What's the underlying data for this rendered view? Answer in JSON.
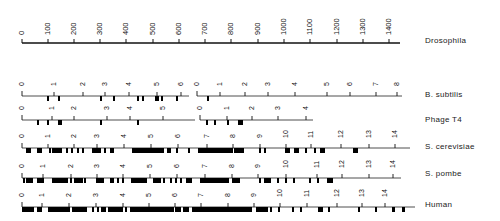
{
  "figure": {
    "scale": {
      "name": "Drosophila",
      "ticks": [
        "0",
        "100",
        "200",
        "300",
        "400",
        "500",
        "600",
        "700",
        "800",
        "900",
        "1000",
        "1100",
        "1200",
        "1300",
        "1400"
      ],
      "x_start": 22,
      "x_end": 150,
      "y": 43,
      "tick_positions": [
        22,
        48,
        74,
        100,
        126,
        153,
        179,
        205,
        231,
        258,
        284,
        310,
        337,
        363,
        389
      ],
      "line_end": 400
    },
    "tracks": [
      {
        "name": "B. subtilis",
        "y": 96,
        "segments": [
          {
            "line": [
              22,
              189
            ],
            "ticks": [
              {
                "l": "0",
                "x": 22
              },
              {
                "l": "1",
                "x": 54
              },
              {
                "l": "2",
                "x": 83
              },
              {
                "l": "3",
                "x": 105
              },
              {
                "l": "4",
                "x": 129
              },
              {
                "l": "5",
                "x": 157
              },
              {
                "l": "6",
                "x": 181
              }
            ]
          },
          {
            "line": [
              197,
              402
            ],
            "ticks": [
              {
                "l": "0",
                "x": 197
              },
              {
                "l": "1",
                "x": 220
              },
              {
                "l": "2",
                "x": 245
              },
              {
                "l": "3",
                "x": 268
              },
              {
                "l": "4",
                "x": 295
              },
              {
                "l": "5",
                "x": 327
              },
              {
                "l": "6",
                "x": 350
              },
              {
                "l": "7",
                "x": 376
              },
              {
                "l": "8",
                "x": 397
              }
            ]
          }
        ],
        "blocks": [
          [
            47,
            2
          ],
          [
            58,
            2
          ],
          [
            100,
            2
          ],
          [
            113,
            2
          ],
          [
            137,
            2
          ],
          [
            142,
            2
          ],
          [
            155,
            4
          ],
          [
            161,
            2
          ],
          [
            176,
            2
          ],
          [
            207,
            2
          ]
        ]
      },
      {
        "name": "Phage T4",
        "y": 120,
        "segments": [
          {
            "line": [
              22,
              195
            ],
            "ticks": [
              {
                "l": "0",
                "x": 22
              },
              {
                "l": "1",
                "x": 52
              },
              {
                "l": "2",
                "x": 74
              },
              {
                "l": "3",
                "x": 107
              },
              {
                "l": "4",
                "x": 130
              },
              {
                "l": "5",
                "x": 163
              }
            ]
          },
          {
            "line": [
              200,
              313
            ],
            "ticks": [
              {
                "l": "0",
                "x": 200
              },
              {
                "l": "1",
                "x": 227
              },
              {
                "l": "2",
                "x": 252
              },
              {
                "l": "3",
                "x": 278
              },
              {
                "l": "4",
                "x": 306
              }
            ]
          }
        ],
        "blocks": [
          [
            37,
            2
          ],
          [
            47,
            2
          ],
          [
            58,
            4
          ],
          [
            100,
            2
          ],
          [
            137,
            2
          ],
          [
            206,
            2
          ],
          [
            214,
            2
          ],
          [
            227,
            2
          ],
          [
            238,
            5
          ]
        ]
      },
      {
        "name": "S. cerevisiae",
        "y": 148,
        "segments": [
          {
            "line": [
              22,
              410
            ],
            "ticks": [
              {
                "l": "0",
                "x": 22
              },
              {
                "l": "1",
                "x": 48
              },
              {
                "l": "2",
                "x": 74
              },
              {
                "l": "3",
                "x": 97
              },
              {
                "l": "4",
                "x": 124
              },
              {
                "l": "5",
                "x": 151
              },
              {
                "l": "6",
                "x": 178
              },
              {
                "l": "7",
                "x": 207
              },
              {
                "l": "8",
                "x": 233
              },
              {
                "l": "9",
                "x": 260
              },
              {
                "l": "10",
                "x": 286
              },
              {
                "l": "11",
                "x": 311
              },
              {
                "l": "12",
                "x": 341
              },
              {
                "l": "13",
                "x": 369
              },
              {
                "l": "14",
                "x": 395
              }
            ]
          }
        ],
        "blocks": [
          [
            26,
            5
          ],
          [
            37,
            5
          ],
          [
            49,
            2
          ],
          [
            52,
            10
          ],
          [
            66,
            2
          ],
          [
            71,
            2
          ],
          [
            77,
            2
          ],
          [
            82,
            2
          ],
          [
            92,
            9
          ],
          [
            104,
            2
          ],
          [
            110,
            4
          ],
          [
            132,
            32
          ],
          [
            167,
            4
          ],
          [
            176,
            2
          ],
          [
            188,
            2
          ],
          [
            198,
            35
          ],
          [
            234,
            10
          ],
          [
            259,
            2
          ],
          [
            264,
            2
          ],
          [
            285,
            5
          ],
          [
            294,
            5
          ],
          [
            305,
            2
          ],
          [
            314,
            2
          ],
          [
            320,
            5
          ],
          [
            353,
            5
          ]
        ]
      },
      {
        "name": "S. pombe",
        "y": 178,
        "segments": [
          {
            "line": [
              22,
              401
            ],
            "ticks": [
              {
                "l": "0",
                "x": 22
              },
              {
                "l": "1",
                "x": 43
              },
              {
                "l": "2",
                "x": 71
              },
              {
                "l": "3",
                "x": 97
              },
              {
                "l": "4",
                "x": 123
              },
              {
                "l": "5",
                "x": 150
              },
              {
                "l": "6",
                "x": 177
              },
              {
                "l": "7",
                "x": 205
              },
              {
                "l": "8",
                "x": 232
              },
              {
                "l": "9",
                "x": 258
              },
              {
                "l": "10",
                "x": 286
              },
              {
                "l": "11",
                "x": 317
              },
              {
                "l": "12",
                "x": 342
              },
              {
                "l": "13",
                "x": 369
              },
              {
                "l": "14",
                "x": 393
              }
            ]
          }
        ],
        "blocks": [
          [
            23,
            2
          ],
          [
            26,
            7
          ],
          [
            37,
            7
          ],
          [
            52,
            16
          ],
          [
            70,
            2
          ],
          [
            74,
            9
          ],
          [
            84,
            2
          ],
          [
            96,
            8
          ],
          [
            110,
            4
          ],
          [
            117,
            2
          ],
          [
            122,
            2
          ],
          [
            131,
            16
          ],
          [
            153,
            8
          ],
          [
            163,
            2
          ],
          [
            170,
            2
          ],
          [
            175,
            2
          ],
          [
            180,
            2
          ],
          [
            186,
            6
          ],
          [
            200,
            29
          ],
          [
            232,
            8
          ],
          [
            259,
            2
          ],
          [
            264,
            7
          ],
          [
            277,
            2
          ],
          [
            285,
            2
          ],
          [
            293,
            2
          ],
          [
            309,
            2
          ],
          [
            317,
            2
          ],
          [
            327,
            6
          ]
        ]
      },
      {
        "name": "Human",
        "y": 207,
        "segments": [
          {
            "line": [
              22,
              415
            ],
            "ticks": [
              {
                "l": "0",
                "x": 22
              },
              {
                "l": "1",
                "x": 42
              },
              {
                "l": "2",
                "x": 69
              },
              {
                "l": "3",
                "x": 96
              },
              {
                "l": "4",
                "x": 123
              },
              {
                "l": "5",
                "x": 149
              },
              {
                "l": "6",
                "x": 175
              },
              {
                "l": "7",
                "x": 201
              },
              {
                "l": "8",
                "x": 228
              },
              {
                "l": "9",
                "x": 254
              },
              {
                "l": "10",
                "x": 280
              },
              {
                "l": "11",
                "x": 307
              },
              {
                "l": "12",
                "x": 337
              },
              {
                "l": "13",
                "x": 362
              },
              {
                "l": "14",
                "x": 385
              }
            ]
          }
        ],
        "blocks": [
          [
            22,
            12
          ],
          [
            37,
            5
          ],
          [
            48,
            22
          ],
          [
            72,
            15
          ],
          [
            92,
            2
          ],
          [
            97,
            2
          ],
          [
            101,
            5
          ],
          [
            108,
            15
          ],
          [
            125,
            2
          ],
          [
            130,
            44
          ],
          [
            175,
            6
          ],
          [
            183,
            6
          ],
          [
            192,
            46
          ],
          [
            238,
            14
          ],
          [
            256,
            12
          ],
          [
            270,
            2
          ],
          [
            278,
            2
          ],
          [
            292,
            2
          ],
          [
            300,
            2
          ],
          [
            318,
            5
          ],
          [
            328,
            2
          ],
          [
            358,
            2
          ],
          [
            375,
            2
          ],
          [
            392,
            3
          ],
          [
            402,
            3
          ]
        ]
      }
    ]
  }
}
